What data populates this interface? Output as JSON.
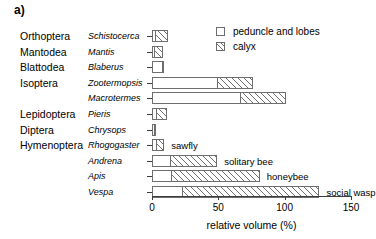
{
  "panel": {
    "label": "a)"
  },
  "legend": {
    "position": "top-right",
    "entries": [
      {
        "name": "peduncle-and-lobes",
        "label": "peduncle and lobes",
        "swatch": "empty-square"
      },
      {
        "name": "calyx",
        "label": "calyx",
        "swatch": "hatched-square"
      }
    ]
  },
  "axis": {
    "title": "relative volume (%)",
    "ticks": [
      0,
      50,
      100,
      150
    ],
    "tick_labels": [
      "0",
      "50",
      "100",
      "150"
    ],
    "range": [
      0,
      150
    ]
  },
  "chart_data": {
    "type": "bar",
    "orientation": "horizontal",
    "title": "",
    "xlabel": "relative volume (%)",
    "ylabel": "",
    "xlim": [
      0,
      150
    ],
    "grid": false,
    "legend_position": "top-right",
    "stacked": true,
    "categories": [
      "Schistocerca",
      "Mantis",
      "Blaberus",
      "Zootermopsis",
      "Macrotermes",
      "Pieris",
      "Chrysops",
      "Rhogogaster",
      "Andrena",
      "Apis",
      "Vespa"
    ],
    "series": [
      {
        "name": "peduncle and lobes",
        "values": [
          3,
          2,
          8,
          50,
          67,
          4,
          2,
          4,
          14,
          15,
          23
        ]
      },
      {
        "name": "calyx",
        "values": [
          10,
          7,
          2,
          27,
          35,
          8,
          1,
          6,
          36,
          67,
          104
        ]
      }
    ],
    "totals": [
      13,
      9,
      10,
      77,
      102,
      12,
      3,
      10,
      50,
      82,
      127
    ]
  },
  "rows": [
    {
      "order": "Orthoptera",
      "genus": "Schistocerca",
      "peduncle": 3,
      "calyx": 10,
      "annotation": ""
    },
    {
      "order": "Mantodea",
      "genus": "Mantis",
      "peduncle": 2,
      "calyx": 7,
      "annotation": ""
    },
    {
      "order": "Blattodea",
      "genus": "Blaberus",
      "peduncle": 8,
      "calyx": 2,
      "annotation": ""
    },
    {
      "order": "Isoptera",
      "genus": "Zootermopsis",
      "peduncle": 50,
      "calyx": 27,
      "annotation": ""
    },
    {
      "order": "",
      "genus": "Macrotermes",
      "peduncle": 67,
      "calyx": 35,
      "annotation": ""
    },
    {
      "order": "Lepidoptera",
      "genus": "Pieris",
      "peduncle": 4,
      "calyx": 8,
      "annotation": ""
    },
    {
      "order": "Diptera",
      "genus": "Chrysops",
      "peduncle": 2,
      "calyx": 1,
      "annotation": ""
    },
    {
      "order": "Hymenoptera",
      "genus": "Rhogogaster",
      "peduncle": 4,
      "calyx": 6,
      "annotation": "sawfly"
    },
    {
      "order": "",
      "genus": "Andrena",
      "peduncle": 14,
      "calyx": 36,
      "annotation": "solitary bee"
    },
    {
      "order": "",
      "genus": "Apis",
      "peduncle": 15,
      "calyx": 67,
      "annotation": "honeybee"
    },
    {
      "order": "",
      "genus": "Vespa",
      "peduncle": 23,
      "calyx": 104,
      "annotation": "social wasp"
    }
  ]
}
